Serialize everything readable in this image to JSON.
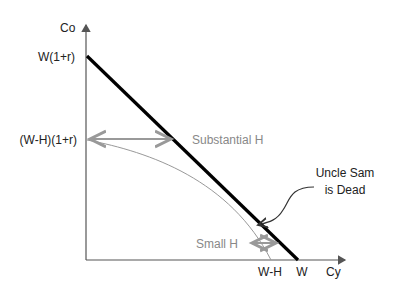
{
  "diagram": {
    "axes": {
      "y_label": "Co",
      "x_label": "Cy"
    },
    "y_ticks": {
      "top": "W(1+r)",
      "middle": "(W-H)(1+r)"
    },
    "x_ticks": {
      "left": "W-H",
      "right": "W"
    },
    "annotations": {
      "substantial": "Substantial H",
      "small": "Small H",
      "callout_line1": "Uncle Sam",
      "callout_line2": "is Dead"
    },
    "colors": {
      "budget_line": "#000000",
      "curve": "#999999",
      "arrows": "#999999",
      "axes": "#555555"
    }
  }
}
